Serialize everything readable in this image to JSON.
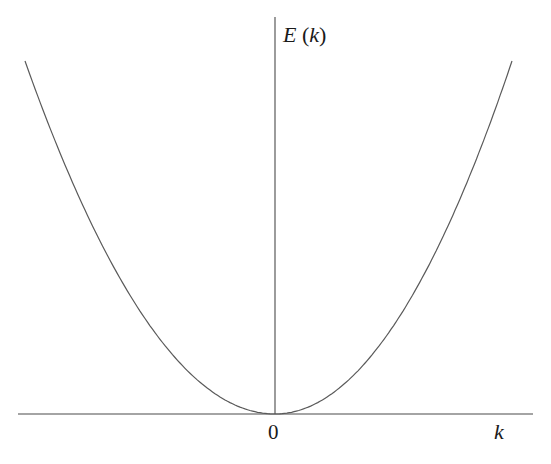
{
  "chart_data": {
    "type": "line",
    "title": "",
    "xlabel": "k",
    "ylabel": "E (k)",
    "ylabel_parts": {
      "symbol": "E",
      "open": "(",
      "arg": "k",
      "close": ")"
    },
    "origin_label": "0",
    "xticks": [
      "0"
    ],
    "yticks": [],
    "grid": false,
    "legend": null,
    "function": "E(k) = c·k^2 (parabola, minimum at origin)",
    "xlim": [
      -1,
      1
    ],
    "ylim": [
      0,
      1.25
    ],
    "series": [
      {
        "name": "E(k)",
        "x": [
          -1.0,
          -0.75,
          -0.5,
          -0.25,
          0,
          0.25,
          0.5,
          0.75,
          1.0
        ],
        "values": [
          1.0,
          0.5625,
          0.25,
          0.0625,
          0,
          0.0625,
          0.25,
          0.5625,
          1.0
        ]
      }
    ],
    "caption": ""
  }
}
